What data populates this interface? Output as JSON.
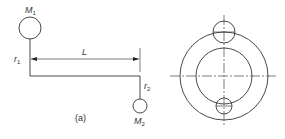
{
  "figure_a": {
    "mass1": {
      "label": "M",
      "sub": "1"
    },
    "mass2": {
      "label": "M",
      "sub": "2"
    },
    "radius1": {
      "label": "r",
      "sub": "1"
    },
    "radius2": {
      "label": "r",
      "sub": "2"
    },
    "length": {
      "label": "L"
    },
    "caption": "(a)"
  },
  "figure_b": {
    "description": "concentric circles with two small circles on vertical centerline"
  },
  "colors": {
    "line": "#333333",
    "background": "#ffffff"
  }
}
